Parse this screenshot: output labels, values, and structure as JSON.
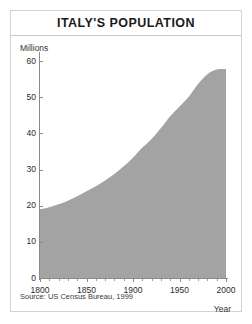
{
  "figure": {
    "title": "ITALY'S POPULATION",
    "source": "Source: US Census Bureau, 1999",
    "units_label": "Millions",
    "xaxis_label": "Year",
    "fill_color": "#a3a3a3",
    "frame_color": "#d2d2d2",
    "axis_color": "#8a8a8a"
  },
  "chart_data": {
    "type": "area",
    "title": "ITALY'S POPULATION",
    "subtitle": "",
    "xlabel": "Year",
    "ylabel": "Millions",
    "xlim": [
      1800,
      2000
    ],
    "ylim": [
      0,
      62
    ],
    "grid": false,
    "legend": null,
    "annotations": [
      "Source: US Census Bureau, 1999"
    ],
    "x_tick_labels": [
      "1800",
      "1850",
      "1900",
      "1950",
      "2000"
    ],
    "x_ticks": [
      1800,
      1850,
      1900,
      1950,
      2000
    ],
    "x_minor_tick_step": 10,
    "y_tick_labels": [
      "0",
      "10",
      "20",
      "30",
      "40",
      "50",
      "60"
    ],
    "y_ticks": [
      0,
      10,
      20,
      30,
      40,
      50,
      60
    ],
    "series": [
      {
        "name": "Population (millions)",
        "color": "#a3a3a3",
        "x": [
          1800,
          1810,
          1820,
          1830,
          1840,
          1850,
          1860,
          1870,
          1880,
          1890,
          1900,
          1910,
          1920,
          1930,
          1940,
          1950,
          1960,
          1970,
          1980,
          1990,
          2000
        ],
        "values": [
          19.0,
          19.6,
          20.4,
          21.4,
          22.6,
          24.0,
          25.4,
          27.0,
          28.8,
          30.9,
          33.3,
          36.1,
          38.5,
          41.5,
          44.8,
          47.5,
          50.2,
          53.7,
          56.4,
          57.7,
          57.8
        ]
      }
    ]
  }
}
